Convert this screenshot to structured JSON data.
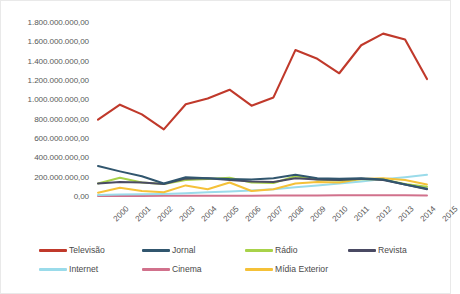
{
  "chart_data": {
    "type": "line",
    "title": "",
    "subtitle": "",
    "xlabel": "",
    "ylabel": "",
    "categories": [
      "2000",
      "2001",
      "2002",
      "2003",
      "2004",
      "2005",
      "2006",
      "2007",
      "2008",
      "2009",
      "2010",
      "2011",
      "2012",
      "2013",
      "2014",
      "2015"
    ],
    "ylim": [
      0,
      1800000000
    ],
    "ytick_values": [
      0,
      200000000,
      400000000,
      600000000,
      800000000,
      1000000000,
      1200000000,
      1400000000,
      1600000000,
      1800000000
    ],
    "ytick_labels": [
      "0,00",
      "200.000.000,00",
      "400.000.000,00",
      "600.000.000,00",
      "800.000.000,00",
      "1.000.000.000,00",
      "1.200.000.000,00",
      "1.400.000.000,00",
      "1.600.000.000,00",
      "1.800.000.000,00"
    ],
    "grid": false,
    "legend_position": "bottom",
    "x_tick_rotation": -45,
    "series": [
      {
        "name": "Televisão",
        "color": "#C0392B",
        "values": [
          800000000,
          955000000,
          855000000,
          700000000,
          960000000,
          1020000000,
          1110000000,
          945000000,
          1030000000,
          1520000000,
          1430000000,
          1280000000,
          1570000000,
          1690000000,
          1630000000,
          1220000000
        ]
      },
      {
        "name": "Jornal",
        "color": "#31566E",
        "values": [
          320000000,
          265000000,
          215000000,
          140000000,
          205000000,
          195000000,
          185000000,
          180000000,
          195000000,
          230000000,
          195000000,
          190000000,
          195000000,
          180000000,
          130000000,
          85000000
        ]
      },
      {
        "name": "Rádio",
        "color": "#A8D24A",
        "values": [
          140000000,
          200000000,
          150000000,
          135000000,
          175000000,
          185000000,
          200000000,
          150000000,
          145000000,
          215000000,
          180000000,
          170000000,
          185000000,
          180000000,
          135000000,
          105000000
        ]
      },
      {
        "name": "Revista",
        "color": "#4A4A63",
        "values": [
          140000000,
          155000000,
          150000000,
          135000000,
          190000000,
          195000000,
          175000000,
          160000000,
          155000000,
          195000000,
          180000000,
          175000000,
          190000000,
          175000000,
          130000000,
          80000000
        ]
      },
      {
        "name": "Internet",
        "color": "#9ADBEA",
        "values": [
          20000000,
          25000000,
          28000000,
          32000000,
          40000000,
          48000000,
          58000000,
          68000000,
          80000000,
          100000000,
          120000000,
          140000000,
          160000000,
          185000000,
          205000000,
          230000000
        ]
      },
      {
        "name": "Cinema",
        "color": "#D1718C",
        "values": [
          10000000,
          11000000,
          11000000,
          12000000,
          13000000,
          13000000,
          14000000,
          14000000,
          15000000,
          16000000,
          16000000,
          17000000,
          17000000,
          18000000,
          17000000,
          16000000
        ]
      },
      {
        "name": "Mídia Exterior",
        "color": "#F5C138",
        "values": [
          45000000,
          95000000,
          62000000,
          50000000,
          120000000,
          80000000,
          150000000,
          62000000,
          80000000,
          140000000,
          155000000,
          150000000,
          185000000,
          195000000,
          175000000,
          130000000
        ]
      }
    ]
  },
  "legend": {
    "rows": [
      [
        {
          "label": "Televisão",
          "color": "#C0392B"
        },
        {
          "label": "Jornal",
          "color": "#31566E"
        },
        {
          "label": "Rádio",
          "color": "#A8D24A"
        },
        {
          "label": "Revista",
          "color": "#4A4A63"
        }
      ],
      [
        {
          "label": "Internet",
          "color": "#9ADBEA"
        },
        {
          "label": "Cinema",
          "color": "#D1718C"
        },
        {
          "label": "Mídia Exterior",
          "color": "#F5C138"
        }
      ]
    ]
  }
}
